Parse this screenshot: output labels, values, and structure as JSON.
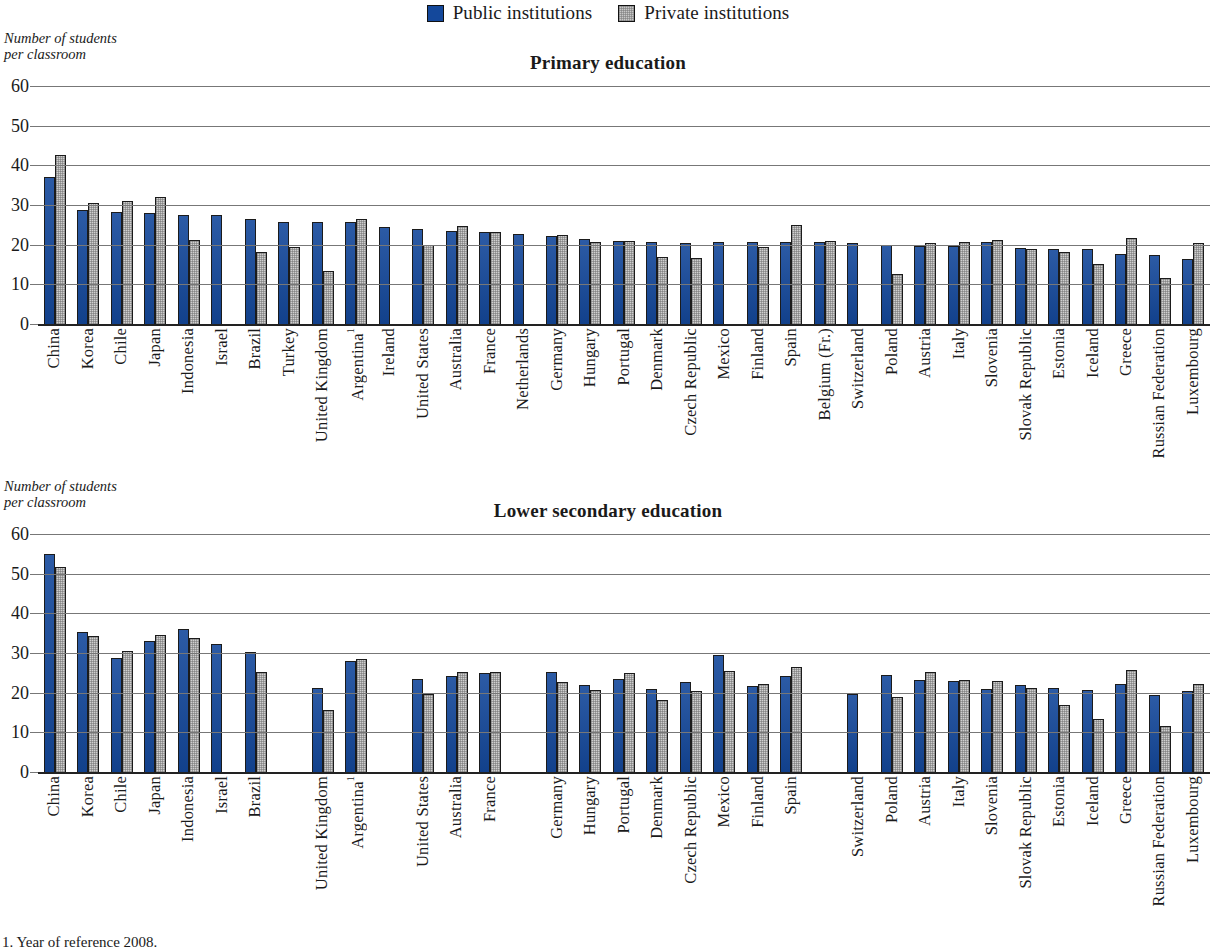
{
  "legend": {
    "items": [
      {
        "label": "Public institutions",
        "key": "public",
        "color": "#14489b"
      },
      {
        "label": "Private institutions",
        "key": "private",
        "color": "#c8c8c8"
      }
    ]
  },
  "axis_caption": "Number of students\nper classroom",
  "footnote": "1. Year of reference 2008.",
  "yaxis": {
    "ticks": [
      0,
      10,
      20,
      30,
      40,
      50,
      60
    ],
    "min": 0,
    "max": 60
  },
  "chart_data": [
    {
      "type": "bar",
      "title": "Primary education",
      "xlabel": "",
      "ylabel": "Number of students per classroom",
      "ylim": [
        0,
        60
      ],
      "yticks": [
        0,
        10,
        20,
        30,
        40,
        50,
        60
      ],
      "grid": true,
      "legend_position": "top-center",
      "categories": [
        "China",
        "Korea",
        "Chile",
        "Japan",
        "Indonesia",
        "Israel",
        "Brazil",
        "Turkey",
        "United Kingdom",
        "Argentina¹",
        "Ireland",
        "United States",
        "Australia",
        "France",
        "Netherlands",
        "Germany",
        "Hungary",
        "Portugal",
        "Denmark",
        "Czech Republic",
        "Mexico",
        "Finland",
        "Spain",
        "Belgium (Fr.)",
        "Switzerland",
        "Poland",
        "Austria",
        "Italy",
        "Slovenia",
        "Slovak Republic",
        "Estonia",
        "Iceland",
        "Greece",
        "Russian Federation",
        "Luxembourg"
      ],
      "series": [
        {
          "name": "Public institutions",
          "values": [
            37.0,
            28.8,
            28.2,
            27.9,
            27.5,
            27.4,
            26.6,
            25.7,
            25.7,
            25.6,
            24.4,
            23.9,
            23.5,
            23.1,
            22.8,
            22.1,
            21.4,
            20.9,
            20.6,
            20.4,
            20.7,
            20.8,
            20.6,
            20.7,
            20.3,
            19.9,
            19.6,
            19.7,
            20.6,
            19.2,
            18.8,
            18.9,
            17.7,
            17.4,
            16.3
          ]
        },
        {
          "name": "Private institutions",
          "values": [
            42.5,
            30.6,
            30.9,
            31.9,
            21.3,
            null,
            18.1,
            19.3,
            13.3,
            26.5,
            null,
            19.9,
            24.8,
            23.3,
            null,
            22.4,
            20.6,
            21.0,
            16.9,
            16.6,
            null,
            19.4,
            25.0,
            21.0,
            null,
            12.7,
            20.4,
            20.6,
            21.1,
            18.9,
            18.2,
            15.2,
            21.7,
            11.7,
            20.4
          ]
        }
      ]
    },
    {
      "type": "bar",
      "title": "Lower secondary education",
      "xlabel": "",
      "ylabel": "Number of students per classroom",
      "ylim": [
        0,
        60
      ],
      "yticks": [
        0,
        10,
        20,
        30,
        40,
        50,
        60
      ],
      "grid": true,
      "legend_position": "top-center",
      "categories": [
        "China",
        "Korea",
        "Chile",
        "Japan",
        "Indonesia",
        "Israel",
        "Brazil",
        "Turkey",
        "United Kingdom",
        "Argentina¹",
        "Ireland",
        "United States",
        "Australia",
        "France",
        "Netherlands",
        "Germany",
        "Hungary",
        "Portugal",
        "Denmark",
        "Czech Republic",
        "Mexico",
        "Finland",
        "Spain",
        "Belgium (Fr.)",
        "Switzerland",
        "Poland",
        "Austria",
        "Italy",
        "Slovenia",
        "Slovak Republic",
        "Estonia",
        "Iceland",
        "Greece",
        "Russian Federation",
        "Luxembourg"
      ],
      "series": [
        {
          "name": "Public institutions",
          "values": [
            55.0,
            35.2,
            28.8,
            33.0,
            36.1,
            32.3,
            30.2,
            null,
            21.3,
            28.0,
            null,
            23.5,
            24.1,
            25.0,
            null,
            25.1,
            21.9,
            23.4,
            21.0,
            22.6,
            29.6,
            21.6,
            24.3,
            null,
            19.7,
            24.4,
            23.3,
            23.0,
            20.9,
            22.0,
            21.3,
            20.8,
            22.3,
            19.3,
            20.3
          ]
        },
        {
          "name": "Private institutions",
          "values": [
            51.8,
            34.3,
            30.6,
            34.6,
            33.7,
            null,
            25.1,
            null,
            15.6,
            28.5,
            null,
            19.6,
            25.1,
            25.2,
            null,
            22.7,
            20.7,
            25.0,
            18.2,
            20.5,
            25.5,
            22.2,
            26.6,
            null,
            null,
            19.0,
            25.2,
            23.2,
            22.9,
            21.3,
            16.8,
            13.4,
            25.6,
            11.5,
            22.1
          ]
        }
      ]
    }
  ]
}
